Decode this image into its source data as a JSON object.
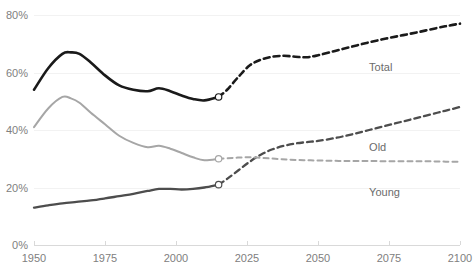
{
  "chart_data": {
    "type": "line",
    "title": "",
    "subtitle": "",
    "xlabel": "",
    "ylabel": "",
    "xlim": [
      1950,
      2100
    ],
    "ylim": [
      0,
      80
    ],
    "grid": true,
    "grid_axis": "y",
    "legend": "inline-labels-right",
    "y_tick_labels": [
      "0%",
      "20%",
      "40%",
      "60%",
      "80%"
    ],
    "y_ticks": [
      0,
      20,
      40,
      60,
      80
    ],
    "x_tick_labels": [
      "1950",
      "1975",
      "2000",
      "2025",
      "2050",
      "2075",
      "2100"
    ],
    "x_ticks": [
      1950,
      1975,
      2000,
      2025,
      2050,
      2075,
      2100
    ],
    "historical_forecast_split_year": 2015,
    "annotations": [
      {
        "name": "total-label",
        "text": "Total",
        "x": 2068,
        "y": 62
      },
      {
        "name": "old-label",
        "text": "Old",
        "x": 2068,
        "y": 34
      },
      {
        "name": "young-label",
        "text": "Young",
        "x": 2068,
        "y": 18.5
      }
    ],
    "series": [
      {
        "name": "Total",
        "color": "#1a1a1a",
        "width": 2.6,
        "x": [
          1950,
          1955,
          1960,
          1963,
          1966,
          1970,
          1975,
          1980,
          1985,
          1990,
          1994,
          1998,
          2002,
          2006,
          2010,
          2015
        ],
        "values": [
          54.0,
          61.5,
          66.5,
          67.0,
          66.5,
          63.5,
          59.0,
          55.5,
          54.0,
          53.5,
          54.5,
          53.5,
          52.0,
          50.8,
          50.3,
          51.5
        ],
        "forecast_x": [
          2015,
          2018,
          2022,
          2026,
          2030,
          2034,
          2038,
          2042,
          2046,
          2050,
          2056,
          2062,
          2068,
          2074,
          2080,
          2086,
          2092,
          2096,
          2100
        ],
        "forecast_values": [
          51.5,
          54.0,
          58.5,
          62.5,
          64.5,
          65.5,
          65.8,
          65.5,
          65.3,
          66.0,
          67.5,
          69.0,
          70.5,
          71.8,
          73.0,
          74.2,
          75.5,
          76.3,
          77.0
        ]
      },
      {
        "name": "Old",
        "color": "#4d4d4d",
        "width": 2.3,
        "x": [
          1950,
          1955,
          1960,
          1965,
          1970,
          1975,
          1980,
          1985,
          1990,
          1994,
          1998,
          2002,
          2006,
          2010,
          2015
        ],
        "values": [
          13.0,
          13.8,
          14.5,
          15.0,
          15.5,
          16.2,
          17.0,
          17.8,
          18.8,
          19.5,
          19.5,
          19.3,
          19.5,
          20.0,
          21.0
        ],
        "forecast_x": [
          2015,
          2018,
          2022,
          2026,
          2030,
          2034,
          2038,
          2042,
          2046,
          2050,
          2056,
          2062,
          2068,
          2074,
          2080,
          2086,
          2092,
          2096,
          2100
        ],
        "forecast_values": [
          21.0,
          23.0,
          26.0,
          29.0,
          31.5,
          33.3,
          34.5,
          35.3,
          35.8,
          36.2,
          37.2,
          38.5,
          40.0,
          41.5,
          43.0,
          44.5,
          46.0,
          47.0,
          48.0
        ]
      },
      {
        "name": "Young",
        "color": "#a6a6a6",
        "width": 2.0,
        "x": [
          1950,
          1955,
          1960,
          1963,
          1966,
          1970,
          1975,
          1980,
          1985,
          1990,
          1994,
          1998,
          2002,
          2006,
          2010,
          2015
        ],
        "values": [
          41.0,
          47.5,
          51.5,
          51.0,
          49.5,
          46.0,
          42.0,
          38.0,
          35.5,
          34.0,
          34.5,
          33.5,
          32.0,
          30.5,
          29.5,
          30.0
        ],
        "forecast_x": [
          2015,
          2020,
          2025,
          2030,
          2035,
          2040,
          2045,
          2050,
          2055,
          2060,
          2065,
          2070,
          2075,
          2080,
          2085,
          2090,
          2095,
          2100
        ],
        "forecast_values": [
          30.0,
          30.3,
          30.5,
          30.3,
          30.0,
          29.7,
          29.5,
          29.4,
          29.3,
          29.2,
          29.2,
          29.2,
          29.1,
          29.1,
          29.1,
          29.1,
          29.0,
          29.0
        ]
      }
    ],
    "split_markers": [
      {
        "series": "Total",
        "x": 2015,
        "y": 51.5
      },
      {
        "series": "Old",
        "x": 2015,
        "y": 21.0
      },
      {
        "series": "Young",
        "x": 2015,
        "y": 30.0
      }
    ]
  }
}
